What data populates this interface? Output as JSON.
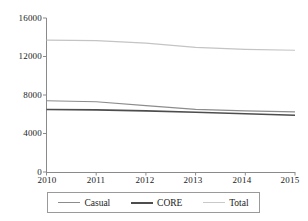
{
  "chart_data": {
    "type": "line",
    "title": "",
    "xlabel": "",
    "ylabel": "",
    "x": [
      2010,
      2011,
      2012,
      2013,
      2014,
      2015
    ],
    "xtick_labels": [
      "2010",
      "2011",
      "2012",
      "2013",
      "2014",
      "2015"
    ],
    "ytick_labels": [
      "0",
      "4000",
      "8000",
      "12000",
      "16000"
    ],
    "yticks": [
      0,
      4000,
      8000,
      12000,
      16000
    ],
    "xlim": [
      2010,
      2015
    ],
    "ylim": [
      0,
      16000
    ],
    "grid": false,
    "legend_position": "bottom",
    "series": [
      {
        "name": "Casual",
        "color": "#8c8c8c",
        "width": 1.2,
        "values": [
          7400,
          7300,
          6900,
          6500,
          6350,
          6250
        ]
      },
      {
        "name": "CORE",
        "color": "#4d4d4d",
        "width": 1.6,
        "values": [
          6500,
          6450,
          6350,
          6200,
          6050,
          5900
        ]
      },
      {
        "name": "Total",
        "color": "#c4c4c4",
        "width": 1.2,
        "values": [
          13700,
          13650,
          13400,
          12950,
          12750,
          12650
        ]
      }
    ]
  },
  "axes": {
    "y_ticks": [
      "16000",
      "12000",
      "8000",
      "4000",
      "0"
    ],
    "x_ticks": [
      "2010",
      "2011",
      "2012",
      "2013",
      "2014",
      "2015"
    ]
  },
  "legend": {
    "items": [
      {
        "label": "Casual"
      },
      {
        "label": "CORE"
      },
      {
        "label": "Total"
      }
    ]
  }
}
